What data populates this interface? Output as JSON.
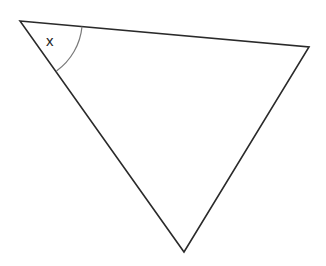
{
  "diagram": {
    "type": "triangle",
    "vertices": {
      "A": [
        20,
        21
      ],
      "B": [
        309,
        47
      ],
      "C": [
        184,
        252
      ]
    },
    "angle_label": "x",
    "angle_at": "A",
    "colors": {
      "stroke": "#2a2a2a",
      "arc": "#7a7a7a",
      "background": "#ffffff"
    }
  }
}
